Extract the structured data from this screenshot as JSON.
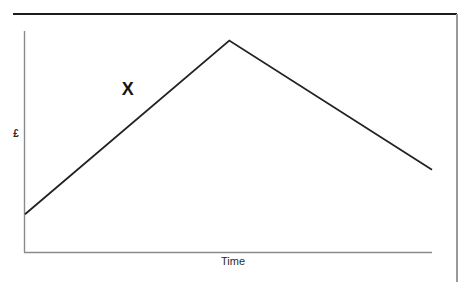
{
  "page": {
    "background_color": "#ffffff",
    "frame": {
      "top_rule_color": "#1c1c1c",
      "right_rule_color": "#9a9a9a"
    }
  },
  "chart_data": {
    "type": "line",
    "title": "",
    "subtitle": "",
    "xlabel": "Time",
    "ylabel": "£",
    "grid": false,
    "legend": null,
    "axis_color": "#8a8a8a",
    "line_color": "#222222",
    "axis_tick_labels": {
      "x": [],
      "y": []
    },
    "xlim": [
      0,
      100
    ],
    "ylim": [
      0,
      100
    ],
    "series": [
      {
        "name": "Price",
        "x": [
          0,
          50.2,
          100
        ],
        "y": [
          9.1,
          97.7,
          31.8
        ]
      }
    ],
    "annotations": [
      {
        "text": "X",
        "x": 26,
        "y": 73,
        "style": "bold"
      }
    ]
  }
}
